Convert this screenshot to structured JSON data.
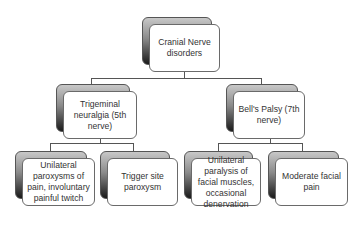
{
  "diagram": {
    "type": "org-chart",
    "root": {
      "label": "Cranial Nerve disorders"
    },
    "branches": [
      {
        "label": "Trigeminal neuralgia (5th nerve)",
        "children": [
          {
            "label": "Unilateral paroxysms of pain, involuntary painful twitch"
          },
          {
            "label": "Trigger site paroxysm"
          }
        ]
      },
      {
        "label": "Bell's Palsy (7th nerve)",
        "children": [
          {
            "label": "Unilateral paralysis of facial muscles, occasional denervation"
          },
          {
            "label": "Moderate facial pain"
          }
        ]
      }
    ],
    "colors": {
      "box_fill": "#ffffff",
      "box_border": "#6a6a6a",
      "shadow_dark": "#1a1a1a",
      "shadow_light": "#c8c8c8",
      "connector": "#555555",
      "text": "#333333"
    }
  }
}
